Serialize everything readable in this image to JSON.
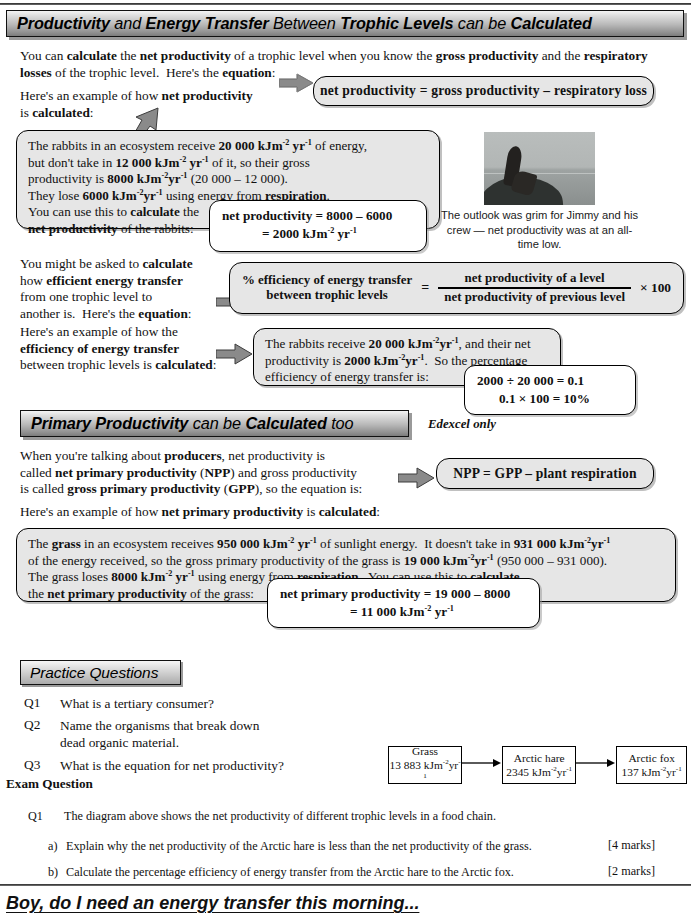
{
  "page": {
    "banner_main": {
      "segments": [
        {
          "text": "Productivity",
          "bold": true
        },
        {
          "text": " and ",
          "bold": false
        },
        {
          "text": "Energy Transfer",
          "bold": true
        },
        {
          "text": " Between ",
          "bold": false
        },
        {
          "text": "Trophic Levels",
          "bold": true
        },
        {
          "text": " can be ",
          "bold": false
        },
        {
          "text": "Calculated",
          "bold": true
        }
      ],
      "plain": "Productivity and Energy Transfer Between Trophic Levels can be Calculated"
    },
    "intro_paragraph": "You can calculate the net productivity of a trophic level when you know the gross productivity and the respiratory losses of the trophic level.  Here's the equation:",
    "intro_line2": "Here's an example of how net productivity",
    "intro_line3": "is calculated:",
    "equation_net_productivity": "net productivity  =  gross productivity  –  respiratory loss",
    "rabbit_box": {
      "line1": "The rabbits in an ecosystem receive 20 000 kJm-2 yr-1 of energy,",
      "line2": "but don't take in 12 000 kJm-2 yr-1 of it, so their gross",
      "line3": "productivity is 8000 kJm-2 yr-1 (20 000 – 12 000).",
      "line4": "They lose 6000 kJm-2 yr-1 using energy from respiration.",
      "line5": "You can use this to calculate the",
      "line6": "net productivity of the rabbits:"
    },
    "rabbit_calc": {
      "line1": "net productivity = 8000 – 6000",
      "line2": "= 2000 kJm-2 yr-1"
    },
    "photo_caption": "The outlook was grim for Jimmy and his crew — net productivity was at an all-time low.",
    "efficiency_intro": "You might be asked to calculate how efficient energy transfer from one trophic level to another is.  Here's the equation:",
    "efficiency_equation": {
      "left_line1": "% efficiency of energy transfer",
      "left_line2": "between trophic levels",
      "equals": "=",
      "numerator": "net productivity of a level",
      "denominator": "net productivity of previous level",
      "multiplier": "× 100"
    },
    "efficiency_example_intro": "Here's an example of how the efficiency of energy transfer between trophic levels is calculated:",
    "efficiency_box": {
      "line1": "The rabbits receive 20 000 kJm-2 yr-1, and their net",
      "line2": "productivity is 2000 kJm-2 yr-1.  So the percentage",
      "line3": "efficiency of energy transfer is:"
    },
    "efficiency_calc": {
      "line1": "2000 ÷ 20 000 = 0.1",
      "line2": "0.1 × 100 = 10%"
    },
    "banner_primary": {
      "segments": [
        {
          "text": "Primary Productivity",
          "bold": true
        },
        {
          "text": " can be ",
          "bold": false
        },
        {
          "text": "Calculated",
          "bold": true
        },
        {
          "text": " too",
          "bold": false
        }
      ],
      "plain": "Primary Productivity can be Calculated too"
    },
    "edexcel_note": "Edexcel only",
    "npp_intro_line1": "When you're talking about producers, net productivity is",
    "npp_intro_line2": "called net primary productivity (NPP) and gross productivity",
    "npp_intro_line3": "is called gross primary productivity (GPP), so the equation is:",
    "npp_equation": "NPP  =  GPP  –  plant respiration",
    "npp_example_intro": "Here's an example of how net primary productivity is calculated:",
    "grass_box": {
      "line1": "The grass in an ecosystem receives 950 000 kJm-2 yr-1 of sunlight energy.  It doesn't take in 931 000 kJm-2yr-1",
      "line2": "of the energy received, so the gross primary productivity of the grass is 19 000 kJm-2 yr-1 (950 000 – 931 000).",
      "line3": "The grass loses 8000 kJm-2 yr-1 using energy from respiration.  You can use this to calculate",
      "line4": "the net primary productivity of the grass:"
    },
    "grass_calc": {
      "line1": "net primary productivity = 19 000 – 8000",
      "line2": "= 11 000 kJm-2 yr-1"
    },
    "practice_questions": {
      "title": "Practice Questions",
      "items": [
        {
          "label": "Q1",
          "text": "What is a tertiary consumer?"
        },
        {
          "label": "Q2",
          "text": "Name the organisms that break down dead organic material."
        },
        {
          "label": "Q3",
          "text": "What is the equation for net productivity?"
        }
      ]
    },
    "food_chain": {
      "nodes": [
        {
          "name": "Grass",
          "value": "13 883 kJm-2yr-1"
        },
        {
          "name": "Arctic hare",
          "value": "2345 kJm-2yr-1"
        },
        {
          "name": "Arctic fox",
          "value": "137 kJm-2yr-1"
        }
      ]
    },
    "exam_question": {
      "title": "Exam Question",
      "label": "Q1",
      "stem": "The diagram above shows the net productivity of different trophic levels in a food chain.",
      "parts": [
        {
          "label": "a)",
          "text": "Explain why the net productivity of the Arctic hare is less than the net productivity of the grass.",
          "marks": "[4 marks]"
        },
        {
          "label": "b)",
          "text": "Calculate the percentage efficiency of energy transfer from the Arctic hare to the Arctic fox.",
          "marks": "[2 marks]"
        }
      ]
    },
    "footer_joke": "Boy, do I need an energy transfer this morning...",
    "colors": {
      "banner_dark": "#8e8e8e",
      "banner_light": "#f4f4f4",
      "box_fill": "#e6e6e6",
      "arrow_fill": "#808080",
      "text": "#111111"
    }
  }
}
